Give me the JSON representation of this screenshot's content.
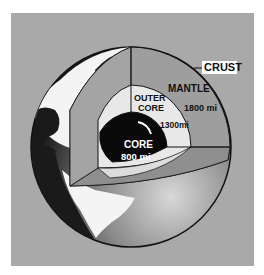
{
  "diagram": {
    "layers": [
      {
        "name": "CRUST",
        "thickness": ""
      },
      {
        "name": "MANTLE",
        "thickness": "1800 mi"
      },
      {
        "name": "OUTER CORE",
        "thickness": "1300 mi"
      },
      {
        "name": "CORE",
        "thickness": "800 mi"
      }
    ],
    "labels": {
      "crust": "CRUST",
      "mantle": "MANTLE",
      "mantle_thickness": "1800 mi",
      "outer_core_line1": "OUTER",
      "outer_core_line2": "CORE",
      "outer_core_thickness": "1300mi",
      "core": "CORE",
      "core_thickness": "800 mi"
    },
    "colors": {
      "background_panel": "#a9a9a9",
      "mantle": "#9e9e9e",
      "outer_core": "#e8e8e8",
      "core": "#0a0a0a",
      "land": "#f4f4f4",
      "ocean_dark": "#1a1a1a"
    }
  }
}
